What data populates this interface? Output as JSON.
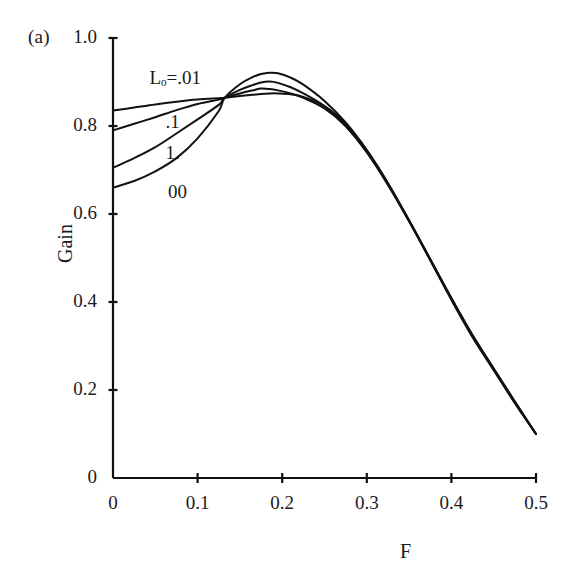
{
  "panel": {
    "label": "(a)"
  },
  "chart_data": {
    "type": "line",
    "title": "",
    "subtitle": "",
    "xlabel": "F",
    "ylabel": "Gain",
    "xlim": [
      0,
      0.5
    ],
    "ylim": [
      0,
      1.0
    ],
    "grid": false,
    "legend_position": "inline-curve-labels",
    "xticks": [
      0,
      0.1,
      0.2,
      0.3,
      0.4,
      0.5
    ],
    "xtick_labels": [
      "0",
      "0.1",
      "0.2",
      "0.3",
      "0.4",
      "0.5"
    ],
    "yticks": [
      0,
      0.2,
      0.4,
      0.6,
      0.8,
      1.0
    ],
    "ytick_labels": [
      "0",
      "0.2",
      "0.4",
      "0.6",
      "0.8",
      "1.0"
    ],
    "line_color": "#111111",
    "background_color": "#ffffff",
    "x": [
      0,
      0.025,
      0.05,
      0.075,
      0.1,
      0.125,
      0.132,
      0.15,
      0.165,
      0.175,
      0.185,
      0.195,
      0.21,
      0.225,
      0.25,
      0.275,
      0.3,
      0.325,
      0.35,
      0.375,
      0.4,
      0.425,
      0.45,
      0.475,
      0.5
    ],
    "series": [
      {
        "name": "L_o=.01",
        "label": "Lₒ=.01",
        "label_text": "Lo=.01",
        "values": [
          0.835,
          0.842,
          0.849,
          0.855,
          0.86,
          0.863,
          0.864,
          0.868,
          0.871,
          0.873,
          0.874,
          0.874,
          0.872,
          0.866,
          0.845,
          0.805,
          0.745,
          0.67,
          0.585,
          0.495,
          0.405,
          0.32,
          0.245,
          0.17,
          0.1
        ]
      },
      {
        "name": ".1",
        "label": ".1",
        "label_text": ".1",
        "values": [
          0.79,
          0.805,
          0.82,
          0.836,
          0.85,
          0.86,
          0.864,
          0.874,
          0.881,
          0.885,
          0.884,
          0.881,
          0.874,
          0.864,
          0.84,
          0.8,
          0.742,
          0.668,
          0.585,
          0.497,
          0.408,
          0.323,
          0.247,
          0.172,
          0.1
        ]
      },
      {
        "name": "1.",
        "label": "1.",
        "label_text": "1.",
        "values": [
          0.705,
          0.727,
          0.752,
          0.783,
          0.815,
          0.848,
          0.864,
          0.882,
          0.893,
          0.899,
          0.901,
          0.898,
          0.888,
          0.874,
          0.845,
          0.8,
          0.74,
          0.666,
          0.583,
          0.496,
          0.408,
          0.324,
          0.248,
          0.173,
          0.1
        ]
      },
      {
        "name": "00",
        "label": "00",
        "label_text": "00",
        "values": [
          0.66,
          0.675,
          0.697,
          0.727,
          0.772,
          0.834,
          0.864,
          0.895,
          0.911,
          0.918,
          0.921,
          0.92,
          0.91,
          0.894,
          0.857,
          0.808,
          0.745,
          0.67,
          0.585,
          0.497,
          0.409,
          0.325,
          0.249,
          0.174,
          0.1
        ]
      }
    ],
    "crossing_point": {
      "x": 0.132,
      "y": 0.864
    },
    "annotations": [
      {
        "text": "Lₒ=.01",
        "x": 0.043,
        "y": 0.905
      },
      {
        "text": ".1",
        "x": 0.062,
        "y": 0.805
      },
      {
        "text": "1.",
        "x": 0.062,
        "y": 0.733
      },
      {
        "text": "00",
        "x": 0.065,
        "y": 0.645
      }
    ]
  }
}
